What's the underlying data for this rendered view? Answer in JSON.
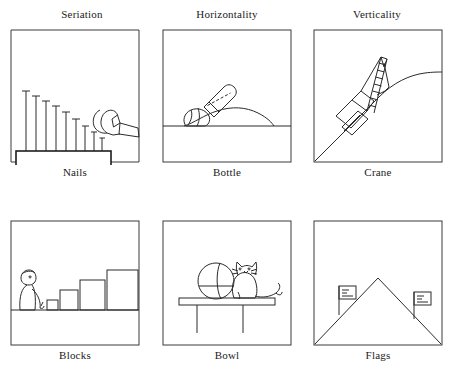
{
  "figure": {
    "title_row": [
      "Seriation",
      "Horizontality",
      "Verticality"
    ],
    "columns": [
      {
        "title": "Seriation",
        "caption": "Nails"
      },
      {
        "title": "Horizontality",
        "caption": "Bottle"
      },
      {
        "title": "Verticality",
        "caption": "Crane"
      }
    ],
    "bottom_row": [
      {
        "caption": "Blocks"
      },
      {
        "caption": "Bowl"
      },
      {
        "caption": "Flags"
      }
    ],
    "panels": [
      {
        "id": "seriation-nails",
        "column_title": "Seriation",
        "caption": "Nails",
        "subject": "row of nine nails of decreasing height hammered into a wooden board, with a claw hammer at the right",
        "nail_count": 9,
        "nail_heights": [
          52,
          47,
          42,
          37,
          32,
          26,
          21,
          15,
          10
        ],
        "tools": [
          "claw-hammer"
        ]
      },
      {
        "id": "horizontality-bottle",
        "column_title": "Horizontality",
        "caption": "Bottle",
        "subject": "tilted bottle resting on a hillside with the liquid surface drawn level",
        "ground": "horizontal line with a sloping hill outline"
      },
      {
        "id": "verticality-crane",
        "column_title": "Verticality",
        "caption": "Crane",
        "subject": "construction crane standing on a sloping hillside with its mast drawn vertical",
        "ground": "diagonal slope rising to a rounded hill crest"
      },
      {
        "id": "seriation-blocks",
        "caption": "Blocks",
        "subject": "seated child arranging four blocks in order of increasing size on the ground",
        "block_count": 4,
        "block_heights": [
          10,
          20,
          30,
          40
        ]
      },
      {
        "id": "horizontality-bowl",
        "caption": "Bowl",
        "subject": "round bowl with a level water line beside a seated cat on a table",
        "table_legs": 2
      },
      {
        "id": "verticality-flags",
        "caption": "Flags",
        "subject": "two flagpoles on the sloping sides of a mountain, drawn vertical",
        "flag_count": 2
      }
    ],
    "colors": {
      "ink": "#2b2b2b",
      "frame": "#3a3a3a",
      "background": "#ffffff",
      "text": "#1b1b1b"
    }
  }
}
